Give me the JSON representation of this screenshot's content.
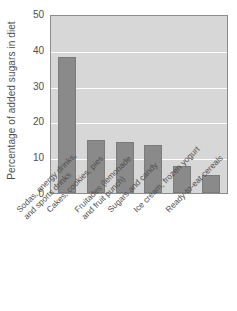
{
  "chart_data": {
    "type": "bar",
    "title": "",
    "xlabel": "",
    "ylabel": "Percentage of added sugars in diet",
    "ylim": [
      0,
      50
    ],
    "yticks": [
      0,
      10,
      20,
      30,
      40,
      50
    ],
    "grid": "horizontal-only",
    "legend": "none",
    "bar_color": "#8a8a8a",
    "plot_background": "#d7d7d7",
    "gridline_color": "#fdfdfd",
    "categories": [
      "Sodas, energy drinks, and sports drinks",
      "Cakes, cookies, pies",
      "Fruitades (lemonade and fruit punch)",
      "Sugars and candy",
      "Ice cream, frozen yogurt",
      "Ready-to-eat cereals"
    ],
    "values": [
      38.5,
      14.9,
      14.3,
      13.7,
      7.7,
      5.2
    ]
  },
  "axis": {
    "y_title": "Percentage of added sugars in diet",
    "y_tick_labels": [
      "50",
      "40",
      "30",
      "20",
      "10",
      "0"
    ],
    "x_tick_labels": [
      {
        "line1": "Sodas, energy drinks,",
        "line2": "and sports drinks"
      },
      {
        "line1": "Cakes, cookies, pies",
        "line2": ""
      },
      {
        "line1": "Fruitades (lemonade",
        "line2": "and fruit punch)"
      },
      {
        "line1": "Sugars and candy",
        "line2": ""
      },
      {
        "line1": "Ice cream, frozen yogurt",
        "line2": ""
      },
      {
        "line1": "Ready-to-eat cereals",
        "line2": ""
      }
    ]
  }
}
